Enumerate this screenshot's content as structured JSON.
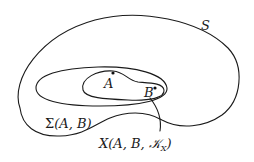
{
  "diagram": {
    "type": "nested-regions",
    "regions": [
      {
        "id": "S",
        "label": "S",
        "description": "outer region"
      },
      {
        "id": "Sigma",
        "label": "Σ(A, B)",
        "description": "middle ellipse-like region"
      },
      {
        "id": "X",
        "label": "X(A, B, 𝒦X)",
        "label_main": "X(A, B, 𝒦",
        "label_sub": "X",
        "label_end": ")",
        "description": "inner region containing A and B"
      }
    ],
    "points": [
      {
        "id": "A",
        "label": "A"
      },
      {
        "id": "B",
        "label": "B"
      }
    ],
    "labels": {
      "S": "S",
      "sigma": "Σ(A, B)",
      "x_main": "X(A, B, 𝒦",
      "x_sub": "X",
      "x_end": ")",
      "point_a": "A",
      "point_b": "B"
    },
    "colors": {
      "stroke": "#1a1a1a",
      "background": "#ffffff"
    }
  }
}
